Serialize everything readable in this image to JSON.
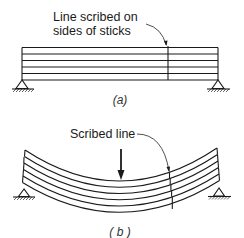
{
  "figure_a": {
    "annotation_line1": "Line scribed on",
    "annotation_line2": "sides of sticks",
    "caption": "(a)",
    "sticks_count": 5,
    "state": "unloaded, straight stack of sticks on two supports"
  },
  "figure_b": {
    "annotation": "Scribed line",
    "caption": "( b )",
    "sticks_count": 5,
    "state": "loaded at midspan, sticks bent and slipping past each other",
    "load_icon": "down-arrow-icon"
  },
  "colors": {
    "ink": "#1a1a1a",
    "background": "#ffffff"
  }
}
